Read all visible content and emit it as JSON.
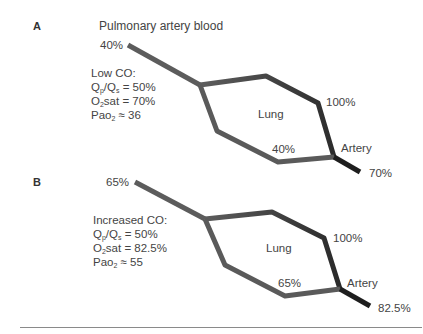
{
  "colors": {
    "venous_line": "#5a5a5a",
    "oxygenated_line": "#2e2e2e",
    "arterial_end": "#1e1e1e",
    "text": "#444444",
    "rule": "#8a8a8a"
  },
  "panels": [
    {
      "letter": "A",
      "title": "Pulmonary artery blood",
      "inflow_sat": "40%",
      "condition": "Low CO:",
      "qp_qs_prefix": "Q",
      "qp_sub": "p",
      "qs_sub": "s",
      "qp_qs_value": " = 50%",
      "o2_prefix": "O",
      "o2_sub": "2",
      "o2sat_value": "sat = 70%",
      "pao2_prefix": "Pao",
      "pao2_sub": "2",
      "pao2_value": " ≈ 36",
      "lung_label": "Lung",
      "pulmonary_vein_sat": "100%",
      "shunt_sat": "40%",
      "artery_label": "Artery",
      "arterial_sat": "70%"
    },
    {
      "letter": "B",
      "inflow_sat": "65%",
      "condition": "Increased CO:",
      "qp_qs_prefix": "Q",
      "qp_sub": "p",
      "qs_sub": "s",
      "qp_qs_value": " = 50%",
      "o2_prefix": "O",
      "o2_sub": "2",
      "o2sat_value": "sat = 82.5%",
      "pao2_prefix": "Pao",
      "pao2_sub": "2",
      "pao2_value": " ≈ 55",
      "lung_label": "Lung",
      "pulmonary_vein_sat": "100%",
      "shunt_sat": "65%",
      "artery_label": "Artery",
      "arterial_sat": "82.5%"
    }
  ]
}
